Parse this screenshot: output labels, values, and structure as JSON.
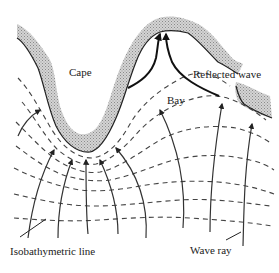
{
  "figure": {
    "labels": {
      "cape": "Cape",
      "bay": "Bay",
      "reflected_wave": "Reflected wave",
      "isobathymetric_line": "Isobathymetric line",
      "wave_ray": "Wave ray"
    },
    "colors": {
      "land_fill": "#bdbdbd",
      "line": "#333333",
      "background": "#ffffff"
    }
  }
}
